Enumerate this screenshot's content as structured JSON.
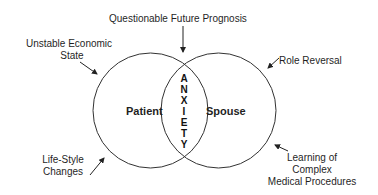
{
  "diagram": {
    "title_label": "Questionable Future Prognosis",
    "left_circle": {
      "label": "Patient"
    },
    "right_circle": {
      "label": "Spouse"
    },
    "overlap": {
      "label": "ANXIETY",
      "letters": [
        "A",
        "N",
        "X",
        "I",
        "E",
        "T",
        "Y"
      ]
    },
    "factors": {
      "top_left": {
        "line1": "Unstable Economic",
        "line2": "State"
      },
      "bottom_left": {
        "line1": "Life-Style",
        "line2": "Changes"
      },
      "top_right": {
        "line1": "Role Reversal"
      },
      "bottom_right": {
        "line1": "Learning of",
        "line2": "Complex",
        "line3": "Medical Procedures"
      }
    },
    "colors": {
      "stroke": "#333333",
      "text": "#1f1f1f",
      "background": "#ffffff"
    }
  }
}
